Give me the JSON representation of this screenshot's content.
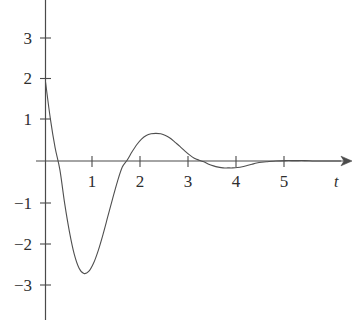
{
  "chart_data": {
    "type": "line",
    "title": "",
    "subtitle": "",
    "xlabel": "t",
    "ylabel": "",
    "xlim": [
      -0.18,
      6.4
    ],
    "ylim": [
      -3.75,
      3.85
    ],
    "grid": false,
    "legend": null,
    "annotations": [],
    "x_ticks": [
      {
        "value": 1,
        "label": "1"
      },
      {
        "value": 2,
        "label": "2"
      },
      {
        "value": 3,
        "label": "3"
      },
      {
        "value": 4,
        "label": "4"
      },
      {
        "value": 5,
        "label": "5"
      }
    ],
    "y_ticks": [
      {
        "value": 3,
        "label": "3"
      },
      {
        "value": 2,
        "label": "2"
      },
      {
        "value": 1,
        "label": "1"
      },
      {
        "value": -1,
        "label": "−1"
      },
      {
        "value": -2,
        "label": "−2"
      },
      {
        "value": -3,
        "label": "−3"
      }
    ],
    "axes": {
      "x_axis_arrow": true,
      "y_axis_arrow": false,
      "origin_label": "",
      "line_color": "#4a4a4a"
    },
    "series": [
      {
        "name": "damped oscillation",
        "color": "#4f4f4f",
        "line_width": 1.1,
        "key_points": [
          {
            "t": 0.0,
            "y": 1.95,
            "note": "start value on y-axis"
          },
          {
            "t": 0.28,
            "y": 0.0,
            "note": "first zero crossing"
          },
          {
            "t": 0.83,
            "y": -2.78,
            "note": "minimum"
          },
          {
            "t": 1.72,
            "y": 0.0,
            "note": "second zero crossing"
          },
          {
            "t": 2.32,
            "y": 0.68,
            "note": "local maximum"
          },
          {
            "t": 3.28,
            "y": 0.0,
            "note": "third zero crossing"
          },
          {
            "t": 3.9,
            "y": -0.17,
            "note": "shallow local minimum"
          },
          {
            "t": 4.75,
            "y": 0.0,
            "note": "fourth zero crossing"
          },
          {
            "t": 6.3,
            "y": 0.0,
            "note": "decays to zero"
          }
        ],
        "x": [
          0,
          0.1,
          0.2,
          0.3,
          0.4,
          0.5,
          0.6,
          0.7,
          0.8,
          0.9,
          1.0,
          1.1,
          1.2,
          1.3,
          1.4,
          1.5,
          1.6,
          1.7,
          1.8,
          1.9,
          2.0,
          2.1,
          2.2,
          2.3,
          2.4,
          2.5,
          2.6,
          2.7,
          2.8,
          2.9,
          3.0,
          3.1,
          3.2,
          3.3,
          3.4,
          3.5,
          3.6,
          3.7,
          3.8,
          3.9,
          4.0,
          4.1,
          4.2,
          4.3,
          4.4,
          4.5,
          4.6,
          4.8,
          5.0,
          5.2,
          5.4,
          5.6,
          5.8,
          6.0,
          6.3
        ],
        "y": [
          1.95,
          1.05,
          0.33,
          -0.22,
          -1.05,
          -1.75,
          -2.3,
          -2.64,
          -2.77,
          -2.72,
          -2.52,
          -2.2,
          -1.8,
          -1.36,
          -0.92,
          -0.5,
          -0.15,
          0.02,
          0.22,
          0.4,
          0.54,
          0.63,
          0.67,
          0.68,
          0.67,
          0.63,
          0.56,
          0.46,
          0.36,
          0.25,
          0.15,
          0.07,
          0.02,
          -0.02,
          -0.08,
          -0.12,
          -0.15,
          -0.17,
          -0.17,
          -0.17,
          -0.16,
          -0.14,
          -0.11,
          -0.08,
          -0.05,
          -0.03,
          -0.02,
          0.0,
          0.01,
          0.01,
          0.01,
          0.0,
          0.0,
          0.0,
          0.0
        ]
      }
    ]
  },
  "labels": {
    "x_axis_name": "t",
    "y_tick_3": "3",
    "y_tick_2": "2",
    "y_tick_1": "1",
    "y_tick_m1": "−1",
    "y_tick_m2": "−2",
    "y_tick_m3": "−3",
    "x_tick_1": "1",
    "x_tick_2": "2",
    "x_tick_3": "3",
    "x_tick_4": "4",
    "x_tick_5": "5"
  },
  "colors": {
    "curve": "#4f4f4f",
    "axis": "#4a4a4a",
    "text": "#2e2e2e",
    "background": "#ffffff"
  }
}
